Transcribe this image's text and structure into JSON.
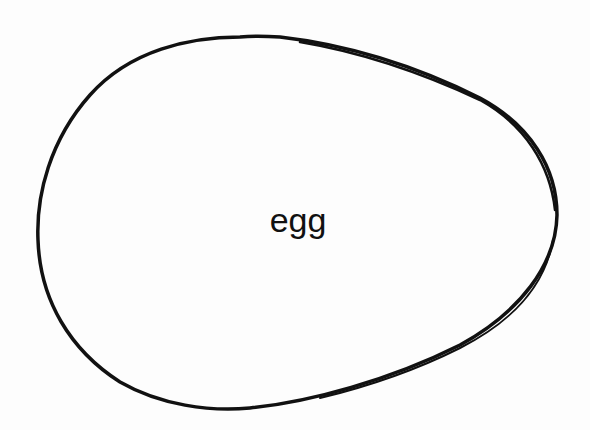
{
  "diagram": {
    "label": "egg",
    "shape": "egg-outline",
    "stroke_color": "#111111",
    "background_color": "#fdfdfd"
  }
}
